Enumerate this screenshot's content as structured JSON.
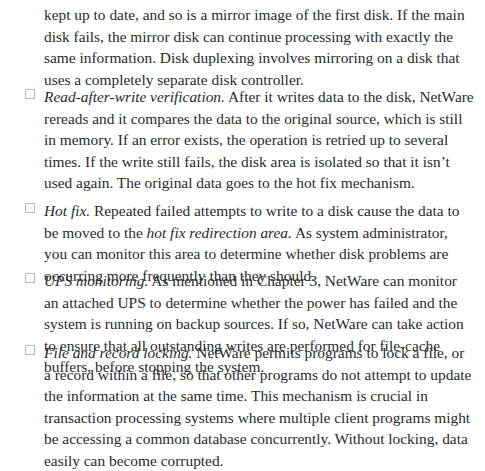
{
  "intro": {
    "text": "kept up to date, and so is a mirror image of the first disk. If the main disk fails, the mirror disk can continue processing with exactly the same information. Disk duplexing involves mirroring on a disk that uses a completely separate disk controller."
  },
  "items": [
    {
      "term": "Read-after-write verification.",
      "text": " After it writes data to the disk, NetWare rereads and it compares the data to the original source, which is still in memory. If an error exists, the operation is retried up to several times. If the write still fails, the disk area is isolated so that it isn’t used again. The original data goes to the hot fix mechanism."
    },
    {
      "term": "Hot fix.",
      "text_before": " Repeated failed attempts to write to a disk cause the data to be moved to the ",
      "italic_phrase": "hot fix redirection area.",
      "text_after": " As system administrator, you can monitor this area to determine whether disk problems are occurring more frequently than they should."
    },
    {
      "term": "UPS monitoring.",
      "text": " As mentioned in Chapter 3, NetWare can monitor an attached UPS to determine whether the power has failed and the system is running on backup sources. If so, NetWare can take action to ensure that all outstanding writes are performed for file-cache buffers, before stopping the system."
    },
    {
      "term": "File and record locking.",
      "text": " NetWare permits programs to lock a file, or a record within a file, so that other programs do not attempt to update the information at the same time. This mechanism is crucial in transaction processing systems where multiple client programs might be accessing a common database concurrently. Without locking, data easily can become corrupted."
    }
  ]
}
